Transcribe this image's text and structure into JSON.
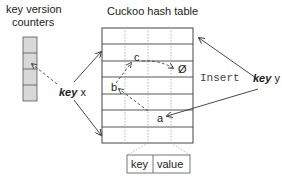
{
  "labels": {
    "counters_title_line1": "key version",
    "counters_title_line2": "counters",
    "table_title": "Cuckoo hash table",
    "key_x_bold": "key",
    "key_x_var": " x",
    "insert": "Insert ",
    "key_y_bold": "key",
    "key_y_var": " y",
    "node_a": "a",
    "node_b": "b",
    "node_c": "c",
    "empty_slot": "Ø",
    "entry_key": "key",
    "entry_value": "value"
  },
  "structure": {
    "counter_cells": 4,
    "table_rows": 7,
    "table_columns": 4
  },
  "colors": {
    "line": "#333333",
    "counter_fill": "#d8d8d8",
    "dotted": "#999999"
  }
}
